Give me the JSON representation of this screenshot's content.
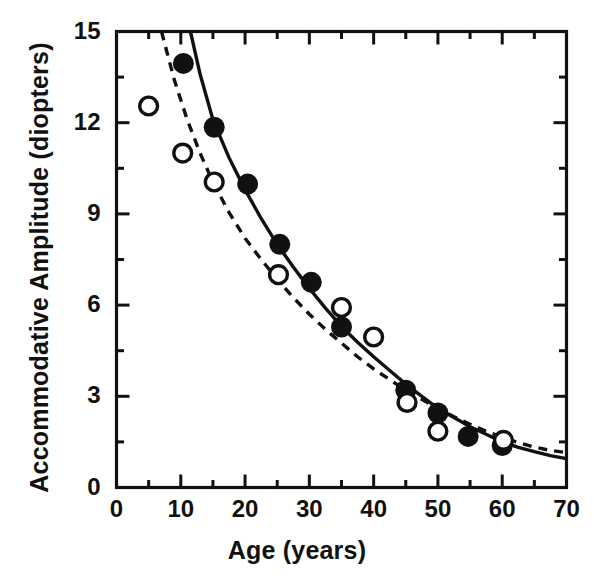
{
  "chart_data": {
    "type": "scatter",
    "title": "",
    "xlabel": "Age  (years)",
    "ylabel": "Accommodative Amplitude  (diopters)",
    "xlim": [
      0,
      70
    ],
    "ylim": [
      0,
      15
    ],
    "grid": false,
    "legend_position": "none",
    "x_ticks_major": [
      0,
      10,
      20,
      30,
      40,
      50,
      60,
      70
    ],
    "x_tick_labels": [
      "0",
      "10",
      "20",
      "30",
      "40",
      "50",
      "60",
      "70"
    ],
    "x_ticks_minor": [
      5,
      15,
      25,
      35,
      45,
      55,
      65
    ],
    "y_ticks_major": [
      0,
      3,
      6,
      9,
      12,
      15
    ],
    "y_tick_labels": [
      "0",
      "3",
      "6",
      "9",
      "12",
      "15"
    ],
    "y_ticks_minor": [
      1.5,
      4.5,
      7.5,
      10.5,
      13.5
    ],
    "series": [
      {
        "name": "filled-circles",
        "marker": "filled-circle",
        "color": "#111111",
        "points": [
          {
            "x": 10.4,
            "y": 13.95
          },
          {
            "x": 15.2,
            "y": 11.85
          },
          {
            "x": 20.4,
            "y": 9.98
          },
          {
            "x": 25.4,
            "y": 8.0
          },
          {
            "x": 30.3,
            "y": 6.75
          },
          {
            "x": 35.0,
            "y": 5.28
          },
          {
            "x": 45.0,
            "y": 3.2
          },
          {
            "x": 50.0,
            "y": 2.45
          },
          {
            "x": 54.7,
            "y": 1.68
          },
          {
            "x": 60.0,
            "y": 1.38
          }
        ]
      },
      {
        "name": "open-circles",
        "marker": "open-circle",
        "color": "#111111",
        "points": [
          {
            "x": 5.0,
            "y": 12.55
          },
          {
            "x": 10.3,
            "y": 11.0
          },
          {
            "x": 15.2,
            "y": 10.05
          },
          {
            "x": 25.2,
            "y": 7.0
          },
          {
            "x": 35.0,
            "y": 5.92
          },
          {
            "x": 40.0,
            "y": 4.95
          },
          {
            "x": 45.2,
            "y": 2.8
          },
          {
            "x": 50.0,
            "y": 1.85
          },
          {
            "x": 60.2,
            "y": 1.55
          }
        ]
      }
    ],
    "curves": [
      {
        "name": "solid-fit-curve",
        "style": "solid",
        "color": "#111111",
        "points": [
          {
            "x": 11.5,
            "y": 15.0
          },
          {
            "x": 13.0,
            "y": 13.6
          },
          {
            "x": 15.0,
            "y": 12.1
          },
          {
            "x": 17.5,
            "y": 10.85
          },
          {
            "x": 20.0,
            "y": 9.8
          },
          {
            "x": 22.5,
            "y": 8.85
          },
          {
            "x": 25.0,
            "y": 8.0
          },
          {
            "x": 27.5,
            "y": 7.25
          },
          {
            "x": 30.0,
            "y": 6.55
          },
          {
            "x": 32.5,
            "y": 5.9
          },
          {
            "x": 35.0,
            "y": 5.3
          },
          {
            "x": 37.5,
            "y": 4.78
          },
          {
            "x": 40.0,
            "y": 4.3
          },
          {
            "x": 42.5,
            "y": 3.85
          },
          {
            "x": 45.0,
            "y": 3.4
          },
          {
            "x": 47.5,
            "y": 3.0
          },
          {
            "x": 50.0,
            "y": 2.6
          },
          {
            "x": 52.5,
            "y": 2.3
          },
          {
            "x": 55.0,
            "y": 2.0
          },
          {
            "x": 57.5,
            "y": 1.75
          },
          {
            "x": 60.0,
            "y": 1.5
          },
          {
            "x": 62.5,
            "y": 1.32
          },
          {
            "x": 65.0,
            "y": 1.18
          },
          {
            "x": 67.5,
            "y": 1.05
          },
          {
            "x": 70.0,
            "y": 0.95
          }
        ]
      },
      {
        "name": "dashed-fit-curve",
        "style": "dashed",
        "color": "#111111",
        "points": [
          {
            "x": 7.0,
            "y": 15.0
          },
          {
            "x": 9.0,
            "y": 13.4
          },
          {
            "x": 11.0,
            "y": 12.1
          },
          {
            "x": 13.0,
            "y": 11.0
          },
          {
            "x": 15.0,
            "y": 10.05
          },
          {
            "x": 17.5,
            "y": 9.05
          },
          {
            "x": 20.0,
            "y": 8.2
          },
          {
            "x": 22.5,
            "y": 7.5
          },
          {
            "x": 25.0,
            "y": 6.85
          },
          {
            "x": 27.5,
            "y": 6.25
          },
          {
            "x": 30.0,
            "y": 5.7
          },
          {
            "x": 32.5,
            "y": 5.2
          },
          {
            "x": 35.0,
            "y": 4.75
          },
          {
            "x": 37.5,
            "y": 4.3
          },
          {
            "x": 40.0,
            "y": 3.9
          },
          {
            "x": 42.5,
            "y": 3.55
          },
          {
            "x": 45.0,
            "y": 3.2
          },
          {
            "x": 47.5,
            "y": 2.9
          },
          {
            "x": 50.0,
            "y": 2.6
          },
          {
            "x": 52.5,
            "y": 2.33
          },
          {
            "x": 55.0,
            "y": 2.08
          },
          {
            "x": 57.5,
            "y": 1.85
          },
          {
            "x": 60.0,
            "y": 1.65
          },
          {
            "x": 62.5,
            "y": 1.48
          },
          {
            "x": 65.0,
            "y": 1.33
          },
          {
            "x": 67.5,
            "y": 1.22
          },
          {
            "x": 70.0,
            "y": 1.15
          }
        ]
      }
    ]
  },
  "axes": {
    "x_title": "Age  (years)",
    "y_title": "Accommodative Amplitude  (diopters)",
    "x_labels": [
      "0",
      "10",
      "20",
      "30",
      "40",
      "50",
      "60",
      "70"
    ],
    "y_labels": [
      "15",
      "12",
      "9",
      "6",
      "3",
      "0"
    ]
  },
  "style": {
    "frame_color": "#111111",
    "marker_fill": "#111111",
    "marker_open_fill": "#ffffff",
    "background": "#ffffff"
  }
}
